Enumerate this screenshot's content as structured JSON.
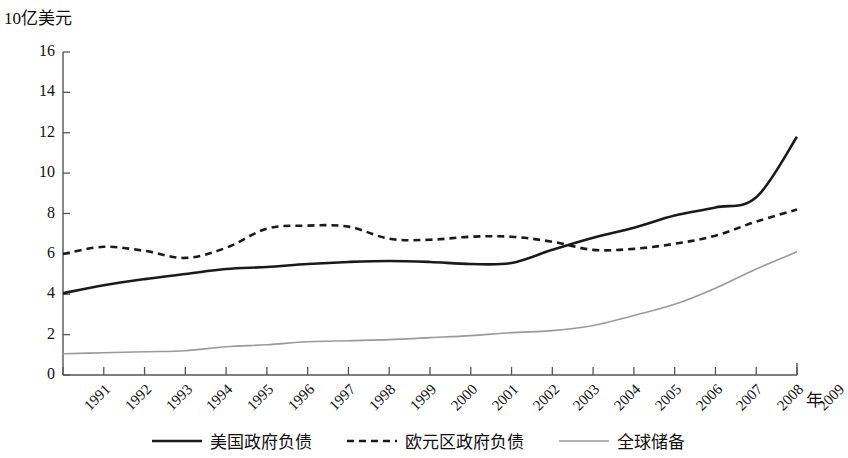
{
  "chart_data": {
    "type": "line",
    "title": "",
    "ylabel": "10亿美元",
    "xlabel": "年",
    "ylim": [
      0,
      16
    ],
    "yticks": [
      "0",
      "2",
      "4",
      "6",
      "8",
      "10",
      "12",
      "14",
      "16"
    ],
    "grid": false,
    "legend_position": "bottom",
    "categories": [
      "1991",
      "1992",
      "1993",
      "1994",
      "1995",
      "1996",
      "1997",
      "1998",
      "1999",
      "2000",
      "2001",
      "2002",
      "2003",
      "2004",
      "2005",
      "2006",
      "2007",
      "2008",
      "2009"
    ],
    "series": [
      {
        "name": "美国政府负债",
        "style": "solid",
        "color": "#1a1a1a",
        "values": [
          4.05,
          4.45,
          4.75,
          5.0,
          5.25,
          5.35,
          5.5,
          5.6,
          5.65,
          5.6,
          5.5,
          5.55,
          6.2,
          6.8,
          7.3,
          7.9,
          8.3,
          8.8,
          11.8
        ]
      },
      {
        "name": "欧元区政府负债",
        "style": "dashed",
        "color": "#1a1a1a",
        "values": [
          6.0,
          6.35,
          6.15,
          5.8,
          6.3,
          7.25,
          7.4,
          7.35,
          6.75,
          6.7,
          6.85,
          6.85,
          6.6,
          6.2,
          6.25,
          6.5,
          6.9,
          7.6,
          8.2
        ]
      },
      {
        "name": "全球储备",
        "style": "thin-gray",
        "color": "#9a9a9a",
        "values": [
          1.05,
          1.1,
          1.15,
          1.2,
          1.4,
          1.5,
          1.65,
          1.7,
          1.75,
          1.85,
          1.95,
          2.1,
          2.2,
          2.45,
          2.95,
          3.5,
          4.3,
          5.25,
          6.1
        ]
      }
    ],
    "series_full": [
      {
        "name": "美国政府负债",
        "points": [
          4.05,
          4.45,
          4.75,
          5.0,
          5.25,
          5.35,
          5.5,
          5.6,
          5.65,
          5.6,
          5.5,
          5.55,
          6.2,
          6.8,
          7.3,
          7.9,
          8.3,
          8.8,
          11.8
        ]
      },
      {
        "name": "欧元区政府负债",
        "points": [
          6.0,
          6.35,
          6.15,
          5.8,
          6.3,
          7.25,
          7.4,
          7.35,
          6.75,
          6.7,
          6.85,
          6.85,
          6.6,
          6.2,
          6.25,
          6.5,
          6.9,
          7.6,
          8.2
        ]
      },
      {
        "name": "全球储备",
        "points": [
          1.05,
          1.1,
          1.15,
          1.2,
          1.4,
          1.5,
          1.65,
          1.7,
          1.75,
          1.85,
          1.95,
          2.1,
          2.2,
          2.45,
          2.95,
          3.5,
          4.3,
          5.25,
          6.1
        ]
      }
    ],
    "series_values": {
      "us_debt": [
        4.05,
        4.45,
        4.75,
        5.0,
        5.25,
        5.35,
        5.5,
        5.6,
        5.65,
        5.6,
        5.5,
        5.55,
        6.2,
        6.8,
        7.3,
        7.9,
        8.3,
        8.8,
        11.8
      ],
      "euro_debt": [
        6.0,
        6.35,
        6.15,
        5.8,
        6.3,
        7.25,
        7.4,
        7.35,
        6.75,
        6.7,
        6.85,
        6.85,
        6.6,
        6.2,
        6.25,
        6.5,
        6.9,
        7.6,
        8.2
      ],
      "global_reserves": [
        1.05,
        1.1,
        1.15,
        1.2,
        1.4,
        1.5,
        1.65,
        1.7,
        1.75,
        1.85,
        1.95,
        2.1,
        2.2,
        2.45,
        2.95,
        3.5,
        4.3,
        5.25,
        6.1
      ]
    },
    "series_corrected": {
      "euro_debt_true": [
        6.0,
        6.35,
        6.15,
        5.8,
        6.3,
        7.25,
        7.4,
        7.35,
        6.75,
        6.7,
        6.85,
        6.85,
        6.4,
        6.3,
        6.35,
        6.5,
        6.9,
        7.6,
        8.4
      ]
    }
  },
  "legend": {
    "items": [
      {
        "label": "美国政府负债",
        "style": "solid",
        "color": "#1a1a1a"
      },
      {
        "label": "欧元区政府负债",
        "style": "dashed",
        "color": "#1a1a1a"
      },
      {
        "label": "全球储备",
        "style": "thin-gray",
        "color": "#9a9a9a"
      }
    ]
  },
  "axes": {
    "y_title": "10亿美元",
    "x_title": "年"
  }
}
